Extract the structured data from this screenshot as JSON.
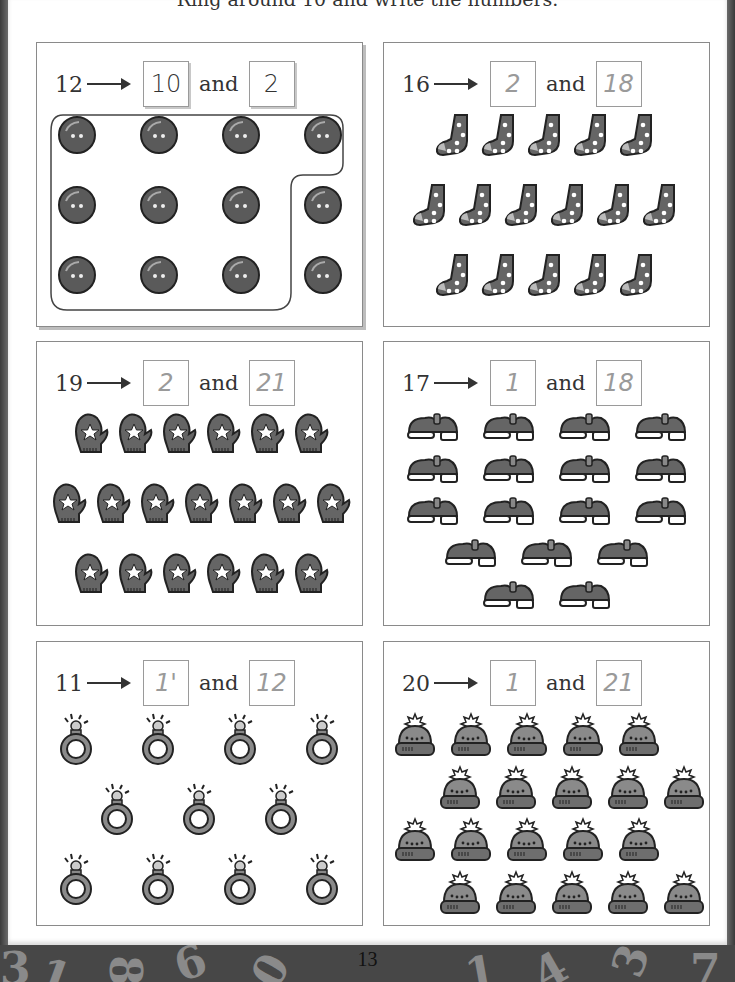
{
  "page": {
    "instruction": "Ring around 10 and write the numbers.",
    "page_number": "13",
    "footer_decor_digits": [
      "3",
      "1",
      "8",
      "6",
      "0",
      "1",
      "4",
      "3",
      "7"
    ]
  },
  "exercises": [
    {
      "id": "buttons",
      "total": "12",
      "box1": "10",
      "and_label": "and",
      "box2": "2",
      "item": "button",
      "item_icon": "button-icon",
      "rows": [
        4,
        4,
        4
      ],
      "box_style": "printed"
    },
    {
      "id": "socks",
      "total": "16",
      "box1": "2",
      "and_label": "and",
      "box2": "18",
      "item": "sock",
      "item_icon": "sock-icon",
      "rows": [
        5,
        6,
        5
      ],
      "box_style": "hand"
    },
    {
      "id": "mittens",
      "total": "19",
      "box1": "2",
      "and_label": "and",
      "box2": "21",
      "item": "mitten",
      "item_icon": "mitten-icon",
      "rows": [
        6,
        7,
        6
      ],
      "box_style": "hand"
    },
    {
      "id": "shoes",
      "total": "17",
      "box1": "1",
      "and_label": "and",
      "box2": "18",
      "item": "shoe",
      "item_icon": "shoe-icon",
      "rows": [
        4,
        4,
        4,
        3,
        2
      ],
      "box_style": "hand"
    },
    {
      "id": "rings",
      "total": "11",
      "box1": "1'",
      "and_label": "and",
      "box2": "12",
      "item": "ring",
      "item_icon": "ring-icon",
      "rows": [
        4,
        3,
        4
      ],
      "box_style": "hand"
    },
    {
      "id": "hats",
      "total": "20",
      "box1": "1",
      "and_label": "and",
      "box2": "21",
      "item": "hat",
      "item_icon": "hat-icon",
      "rows": [
        5,
        5,
        5,
        5
      ],
      "box_style": "hand"
    }
  ],
  "colors": {
    "item_fill": "#6b6b6b",
    "item_stroke": "#2e2e2e",
    "border_dark": "#474747",
    "panel_border": "#8a8a8a"
  }
}
